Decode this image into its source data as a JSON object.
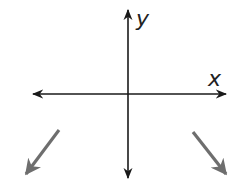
{
  "diagram": {
    "type": "coordinate-axes-end-behavior",
    "axis_labels": {
      "x": "x",
      "y": "y"
    },
    "colors": {
      "axes": "#1a1a1a",
      "end_arrows": "#6e6e6e"
    },
    "end_behavior": {
      "left": "down-left arrow (as x → -∞, y → -∞)",
      "right": "down-right arrow (as x → +∞, y → -∞)"
    }
  }
}
